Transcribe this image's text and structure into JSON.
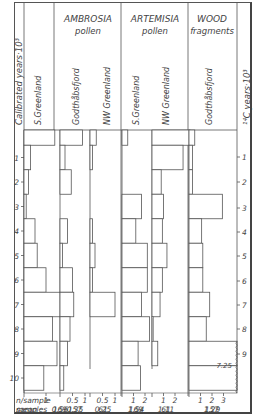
{
  "chart_data": {
    "type": "bar",
    "orientation": "horizontal-step (pollen diagram)",
    "left_axis": {
      "label": "Calibrated years·10³",
      "ticks": [
        1,
        2,
        3,
        4,
        5,
        6,
        7,
        8,
        9,
        10
      ]
    },
    "right_axis": {
      "label": "¹⁴C years·10³",
      "ticks": [
        1,
        2,
        3,
        4,
        5,
        6,
        7,
        8,
        9
      ]
    },
    "groups": [
      {
        "title": "AMBROSIA",
        "subtitle": "pollen",
        "series": [
          "S.Greenland",
          "Godthåbsfjord",
          "NW Greenland"
        ]
      },
      {
        "title": "ARTEMISIA",
        "subtitle": "pollen",
        "series": [
          "S.Greenland",
          "NW Greenland"
        ]
      },
      {
        "title": "WOOD",
        "subtitle": "fragments",
        "series": [
          "Godthåbsfjord"
        ]
      }
    ],
    "intervals_cal_kyr": [
      [
        0,
        0.5
      ],
      [
        0.5,
        1.5
      ],
      [
        1.5,
        2.5
      ],
      [
        2.5,
        3.5
      ],
      [
        3.5,
        4.5
      ],
      [
        4.5,
        5.5
      ],
      [
        5.5,
        6.5
      ],
      [
        6.5,
        7.5
      ],
      [
        7.5,
        8.5
      ],
      [
        8.5,
        9.5
      ],
      [
        9.5,
        10.5
      ]
    ],
    "series": [
      {
        "name": "Ambrosia S.Greenland",
        "unit": "n/sample",
        "ticks": [
          1
        ],
        "mean": 0.56,
        "samples": 169,
        "values": [
          1.4,
          0.3,
          0.2,
          0.1,
          0.5,
          0.6,
          1.0,
          2.1,
          1.3,
          1.5,
          0.9
        ]
      },
      {
        "name": "Ambrosia Godthåbsfjord",
        "unit": "n/sample",
        "ticks": [
          0.5,
          1
        ],
        "mean": 0.35,
        "samples": 157,
        "values": [
          0.9,
          0.2,
          0.45,
          0.0,
          0.3,
          0.1,
          0.5,
          0.55,
          0.4,
          0.3,
          0.15
        ]
      },
      {
        "name": "Ambrosia NW Greenland",
        "unit": "n/sample",
        "ticks": [
          0.5,
          1
        ],
        "mean": 0.25,
        "samples": 61,
        "values": [
          0.25,
          0.1,
          0.0,
          0.0,
          0.1,
          0.2,
          0.1,
          1.0,
          0.0,
          0.0,
          null
        ]
      },
      {
        "name": "Artemisia S.Greenland",
        "unit": "n/sample",
        "ticks": [
          1,
          2
        ],
        "mean": 1.54,
        "samples": 169,
        "values": [
          0.5,
          0.0,
          0.0,
          1.7,
          1.2,
          2.2,
          2.2,
          1.7,
          2.4,
          1.4,
          1.6
        ]
      },
      {
        "name": "Artemisia NW Greenland",
        "unit": "n/sample",
        "ticks": [
          1,
          2
        ],
        "mean": 1.11,
        "samples": 61,
        "values": [
          3.3,
          2.7,
          0.8,
          1.0,
          0.9,
          1.3,
          0.9,
          0.7,
          0.1,
          0.5,
          null
        ]
      },
      {
        "name": "Wood Godthåbsfjord",
        "unit": "n/sample",
        "ticks": [
          1,
          2,
          3
        ],
        "mean": 1.29,
        "samples": 157,
        "values": [
          0.5,
          0.3,
          0.3,
          2.9,
          1.1,
          1.2,
          1.2,
          1.8,
          1.5,
          7.25,
          7.25
        ]
      }
    ],
    "annotations": [
      "7.25"
    ]
  },
  "labels": {
    "left_axis": "Calibrated years·10³",
    "right_axis_c": "¹⁴C years·10³",
    "ambrosia_title": "AMBROSIA",
    "ambrosia_sub": "pollen",
    "artemisia_title": "ARTEMISIA",
    "artemisia_sub": "pollen",
    "wood_title": "WOOD",
    "wood_sub": "fragments",
    "col_s_greenland": "S.Greenland",
    "col_godthab": "Godthåbsfjord",
    "col_nw_greenland": "NW Greenland",
    "row_n": "n/sample",
    "row_mean": "mean",
    "row_samples": "samples",
    "wood_break": "7.25"
  }
}
